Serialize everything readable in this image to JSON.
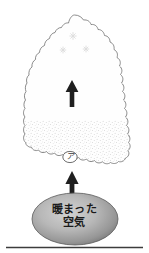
{
  "figure": {
    "type": "meteorology-diagram",
    "caption_language": "ja",
    "background_color": "#ffffff",
    "width": 149,
    "height": 253
  },
  "cloud": {
    "name": "cumulonimbus-cloud",
    "outline_color": "#6e6e6e",
    "fill_color": "#fefefe",
    "shape": "tall bumpy anvil-less cumulonimbus, wide rounded base, tapering rounded top",
    "precipitation_region": {
      "name": "stipple-region",
      "description": "dense fine stipple dots in lower third of cloud representing water droplets",
      "dot_color": "#b9b9b9"
    }
  },
  "snowflakes": {
    "label": "snowflake-marks",
    "color": "#d8d8d8",
    "count": 3,
    "positions": [
      {
        "x": 73,
        "y": 36,
        "size": 7
      },
      {
        "x": 63,
        "y": 50,
        "size": 6
      },
      {
        "x": 86,
        "y": 49,
        "size": 6
      }
    ]
  },
  "arrows": [
    {
      "name": "updraft-arrow-inside-cloud",
      "direction": "up",
      "color": "#1f1f1f",
      "x": 72,
      "y_top": 80,
      "y_bottom": 107
    },
    {
      "name": "warm-air-inflow-arrow",
      "direction": "up",
      "color": "#1f1f1f",
      "x": 72,
      "y_top": 171,
      "y_bottom": 196
    }
  ],
  "marker": {
    "name": "annotation-marker-a",
    "text": "ア",
    "enclosure": "circle",
    "circle_color": "#4a4a4a",
    "x": 70,
    "y": 157
  },
  "warm_air": {
    "name": "warm-air-ellipse",
    "line1": "暖まった",
    "line2": "空気",
    "full_text": "暖まった空気",
    "text_color": "#1a1a1a",
    "fill_center_color": "#c9c9c9",
    "fill_edge_color": "#7a7a7a",
    "outline_color": "#555555",
    "cx": 75,
    "cy": 219,
    "rx": 43,
    "ry": 26
  },
  "baseline": {
    "name": "ground-line",
    "color": "#3c3c3c",
    "y": 247,
    "x_start": 6,
    "x_end": 143
  }
}
